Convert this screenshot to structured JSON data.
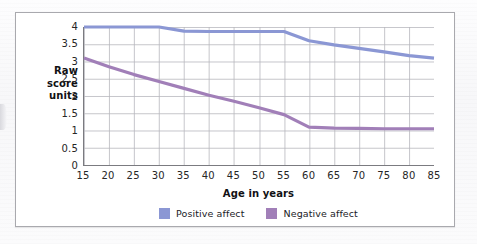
{
  "figure": {
    "panel_border_color": "#a9a9ae",
    "background_color": "#ffffff"
  },
  "chart_data": {
    "type": "line",
    "title": "",
    "subtitle": "",
    "xlabel": "Age in years",
    "ylabel": "Raw score units",
    "ylabel_lines": [
      "Raw",
      "score",
      "units"
    ],
    "x": [
      15,
      20,
      25,
      30,
      35,
      40,
      45,
      50,
      55,
      60,
      65,
      70,
      75,
      80,
      85
    ],
    "categories": [
      "15",
      "20",
      "25",
      "30",
      "35",
      "40",
      "45",
      "50",
      "55",
      "60",
      "65",
      "70",
      "75",
      "80",
      "85"
    ],
    "xlim": [
      15,
      85
    ],
    "ylim": [
      0,
      4
    ],
    "xticks": [
      15,
      20,
      25,
      30,
      35,
      40,
      45,
      50,
      55,
      60,
      65,
      70,
      75,
      80,
      85
    ],
    "xtick_labels": [
      "15",
      "20",
      "25",
      "30",
      "35",
      "40",
      "45",
      "50",
      "55",
      "60",
      "65",
      "70",
      "75",
      "80",
      "85"
    ],
    "yticks": [
      0,
      0.5,
      1,
      1.5,
      2,
      2.5,
      3,
      3.5,
      4
    ],
    "ytick_labels": [
      "0",
      "0.5",
      "1",
      "1.5",
      "2",
      "2.5",
      "3",
      "3.5",
      "4"
    ],
    "grid": true,
    "grid_color": "#b7b7bd",
    "legend_position": "bottom-center",
    "series": [
      {
        "name": "Positive affect",
        "color": "#8b97d4",
        "values": [
          4.0,
          4.0,
          4.0,
          4.0,
          3.88,
          3.87,
          3.87,
          3.87,
          3.87,
          3.6,
          3.48,
          3.38,
          3.28,
          3.17,
          3.1
        ]
      },
      {
        "name": "Negative affect",
        "color": "#a17fb8",
        "values": [
          3.1,
          2.85,
          2.62,
          2.42,
          2.22,
          2.02,
          1.85,
          1.66,
          1.46,
          1.1,
          1.07,
          1.06,
          1.05,
          1.05,
          1.05
        ]
      }
    ]
  },
  "legend": {
    "items": [
      {
        "label": "Positive affect",
        "color": "#8b97d4"
      },
      {
        "label": "Negative affect",
        "color": "#a17fb8"
      }
    ]
  }
}
